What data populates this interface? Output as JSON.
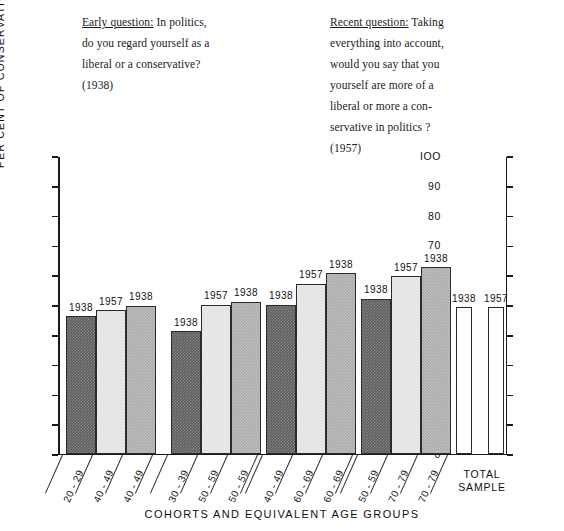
{
  "annotations": {
    "early": {
      "label": "Early question:",
      "lines": [
        "In politics,",
        "do you regard yourself as a",
        "liberal or a conservative?",
        "(1938)"
      ]
    },
    "recent": {
      "label": "Recent question:",
      "lines": [
        "Taking",
        "everything into account,",
        "would you say that you",
        "yourself are more of a",
        "liberal or more a con-",
        "servative in politics ?",
        "(1957)"
      ]
    }
  },
  "chart_data": {
    "type": "bar",
    "title": "",
    "xlabel": "COHORTS AND  EQUIVALENT  AGE  GROUPS",
    "ylabel": "PER  CENT  OF  CONSERVATIVE  OPINION",
    "ylim": [
      0,
      100
    ],
    "yticks": [
      0,
      10,
      20,
      30,
      40,
      50,
      60,
      70,
      80,
      90,
      100
    ],
    "ytick_labels": [
      "0",
      "IO",
      "20",
      "30",
      "40",
      "50",
      "60",
      "70",
      "80",
      "90",
      "IOO"
    ],
    "right_axis": true,
    "grid": false,
    "legend": "none",
    "series_note": "Each bar is annotated with its survey year (1938 or 1957).",
    "groups": [
      {
        "name": "group-1",
        "bars": [
          {
            "category": "20 - 29",
            "year": "1938",
            "value": 46,
            "fill": "dark"
          },
          {
            "category": "40 - 49",
            "year": "1957",
            "value": 48,
            "fill": "light"
          },
          {
            "category": "40 - 49",
            "year": "1938",
            "value": 49.5,
            "fill": "medium"
          }
        ]
      },
      {
        "name": "group-2",
        "bars": [
          {
            "category": "30 - 39",
            "year": "1938",
            "value": 41,
            "fill": "dark"
          },
          {
            "category": "50 - 59",
            "year": "1957",
            "value": 50,
            "fill": "light"
          },
          {
            "category": "50 - 59",
            "year": "1938",
            "value": 51,
            "fill": "medium"
          }
        ]
      },
      {
        "name": "group-3",
        "bars": [
          {
            "category": "40 - 49",
            "year": "1938",
            "value": 50,
            "fill": "dark"
          },
          {
            "category": "60 - 69",
            "year": "1957",
            "value": 57,
            "fill": "light"
          },
          {
            "category": "60 - 69",
            "year": "1938",
            "value": 60.5,
            "fill": "medium"
          }
        ]
      },
      {
        "name": "group-4",
        "bars": [
          {
            "category": "50 - 59",
            "year": "1938",
            "value": 52,
            "fill": "dark"
          },
          {
            "category": "70 - 79",
            "year": "1957",
            "value": 59.5,
            "fill": "light"
          },
          {
            "category": "70 - 79",
            "year": "1938",
            "value": 62.5,
            "fill": "medium"
          }
        ]
      },
      {
        "name": "total-sample",
        "label_line1": "TOTAL",
        "label_line2": "SAMPLE",
        "bars": [
          {
            "category": "TOTAL SAMPLE",
            "year": "1938",
            "value": 49,
            "fill": "white"
          },
          {
            "category": "TOTAL SAMPLE",
            "year": "1957",
            "value": 49,
            "fill": "white"
          }
        ]
      }
    ]
  },
  "colors": {
    "dark_bar": "#5d5d5d",
    "light_bar": "#ececec",
    "medium_bar": "#aaaaaa",
    "white_bar": "#ffffff",
    "axis": "#1a1a1a"
  }
}
